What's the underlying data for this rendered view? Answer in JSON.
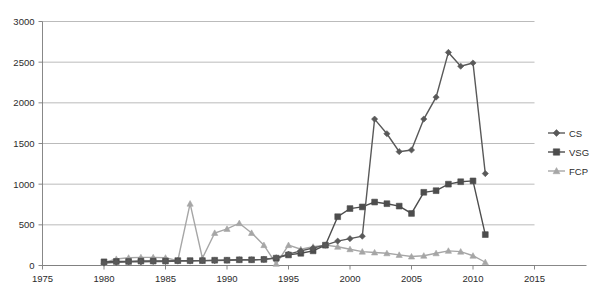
{
  "chart_data": {
    "type": "line",
    "title": "",
    "subtitle": "",
    "xlabel": "",
    "ylabel": "",
    "xlim": [
      1975,
      2015
    ],
    "ylim": [
      0,
      3000
    ],
    "xticks": [
      1975,
      1980,
      1985,
      1990,
      1995,
      2000,
      2005,
      2010,
      2015
    ],
    "yticks": [
      0,
      500,
      1000,
      1500,
      2000,
      2500,
      3000
    ],
    "xtick_labels": [
      "1975",
      "1980",
      "1985",
      "1990",
      "1995",
      "2000",
      "2005",
      "2010",
      "2015"
    ],
    "ytick_labels": [
      "0",
      "500",
      "1000",
      "1500",
      "2000",
      "2500",
      "3000"
    ],
    "grid": true,
    "grid_axis": "y",
    "legend_position": "right",
    "x": [
      1980,
      1981,
      1982,
      1983,
      1984,
      1985,
      1986,
      1987,
      1988,
      1989,
      1990,
      1991,
      1992,
      1993,
      1994,
      1995,
      1996,
      1997,
      1998,
      1999,
      2000,
      2001,
      2002,
      2003,
      2004,
      2005,
      2006,
      2007,
      2008,
      2009,
      2010,
      2011
    ],
    "series": [
      {
        "name": "CS",
        "marker": "diamond",
        "color": "#595959",
        "values": [
          30,
          40,
          45,
          45,
          50,
          50,
          55,
          55,
          60,
          60,
          65,
          70,
          70,
          75,
          95,
          140,
          180,
          215,
          250,
          300,
          330,
          360,
          1800,
          1620,
          1400,
          1420,
          1800,
          2070,
          2620,
          2450,
          2490,
          1130
        ]
      },
      {
        "name": "VSG",
        "marker": "square",
        "color": "#4d4d4d",
        "values": [
          45,
          50,
          50,
          55,
          55,
          55,
          60,
          60,
          60,
          65,
          65,
          70,
          70,
          75,
          90,
          130,
          150,
          180,
          250,
          600,
          700,
          720,
          780,
          760,
          730,
          640,
          900,
          920,
          1000,
          1030,
          1040,
          380
        ]
      },
      {
        "name": "FCP",
        "marker": "triangle",
        "color": "#a6a6a6",
        "values": [
          35,
          80,
          95,
          100,
          100,
          95,
          60,
          760,
          90,
          400,
          450,
          520,
          400,
          250,
          20,
          250,
          200,
          230,
          250,
          230,
          200,
          170,
          160,
          150,
          130,
          110,
          120,
          150,
          180,
          170,
          120,
          40
        ]
      }
    ]
  },
  "legend": {
    "entries": [
      {
        "label": "CS"
      },
      {
        "label": "VSG"
      },
      {
        "label": "FCP"
      }
    ]
  }
}
